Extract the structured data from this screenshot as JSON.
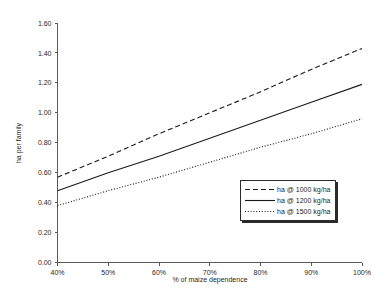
{
  "chart_data": {
    "type": "line",
    "title": "",
    "xlabel": "% of maize dependence",
    "ylabel": "ha per family",
    "x": [
      40,
      50,
      60,
      70,
      80,
      90,
      100
    ],
    "xtick_labels": [
      "40%",
      "50%",
      "60%",
      "70%",
      "80%",
      "90%",
      "100%"
    ],
    "ytick_labels": [
      "0.00",
      "0.20",
      "0.40",
      "0.60",
      "0.80",
      "1.00",
      "1.20",
      "1.40",
      "1.60"
    ],
    "ytick_values": [
      0.0,
      0.2,
      0.4,
      0.6,
      0.8,
      1.0,
      1.2,
      1.4,
      1.6
    ],
    "xlim": [
      40,
      100
    ],
    "ylim": [
      0.0,
      1.6
    ],
    "grid": false,
    "legend_position": "lower-right",
    "series": [
      {
        "name": "ha @ 1000 kg/ha",
        "style": "dashed",
        "color": "#1a1a1a",
        "values": [
          0.57,
          0.71,
          0.86,
          1.0,
          1.14,
          1.29,
          1.43
        ]
      },
      {
        "name": "ha @ 1200 kg/ha",
        "style": "solid",
        "color": "#1a1a1a",
        "values": [
          0.48,
          0.6,
          0.71,
          0.83,
          0.95,
          1.07,
          1.19
        ]
      },
      {
        "name": "ha @ 1500 kg/ha",
        "style": "dotted",
        "color": "#1a1a1a",
        "values": [
          0.38,
          0.48,
          0.57,
          0.67,
          0.77,
          0.86,
          0.96
        ]
      }
    ]
  },
  "axes": {
    "x_title": "% of maize dependence",
    "y_title": "ha per family",
    "y_ticks": [
      "1.60",
      "1.40",
      "1.20",
      "1.00",
      "0.80",
      "0.60",
      "0.40",
      "0.20",
      "0.00"
    ],
    "x_ticks": [
      "40%",
      "50%",
      "60%",
      "70%",
      "80%",
      "90%",
      "100%"
    ]
  },
  "legend": {
    "items": [
      {
        "label": "ha @ 1000 kg/ha",
        "style": "dashed"
      },
      {
        "label": "ha @ 1200 kg/ha",
        "style": "solid"
      },
      {
        "label": "ha @ 1500 kg/ha",
        "style": "dotted"
      }
    ]
  }
}
